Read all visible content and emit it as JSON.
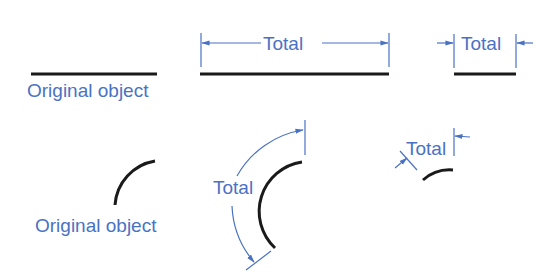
{
  "colors": {
    "object": "#1a1a1a",
    "dimension": "#4a72c4",
    "background": "#ffffff"
  },
  "panels": {
    "line_original": {
      "label": "Original object"
    },
    "line_total_stretched": {
      "label": "Total"
    },
    "line_total_compressed": {
      "label": "Total"
    },
    "arc_original": {
      "label": "Original object"
    },
    "arc_total_stretched": {
      "label": "Total"
    },
    "arc_total_compressed": {
      "label": "Total"
    }
  }
}
